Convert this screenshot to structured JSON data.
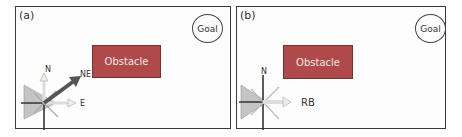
{
  "panels": [
    {
      "label": "(a)",
      "goal": "Goal",
      "obstacle": "Obstacle",
      "compass": {
        "north": "N",
        "northeast": "NE",
        "east": "E"
      },
      "highlighted_direction": "NE"
    },
    {
      "label": "(b)",
      "goal": "Goal",
      "obstacle": "Obstacle",
      "compass": {
        "north": "N",
        "action": "RB"
      },
      "highlighted_direction": "E"
    }
  ],
  "colors": {
    "obstacle": "#b04a4a",
    "arrow_dark": "#555555",
    "cone": "#bdbdbd"
  }
}
